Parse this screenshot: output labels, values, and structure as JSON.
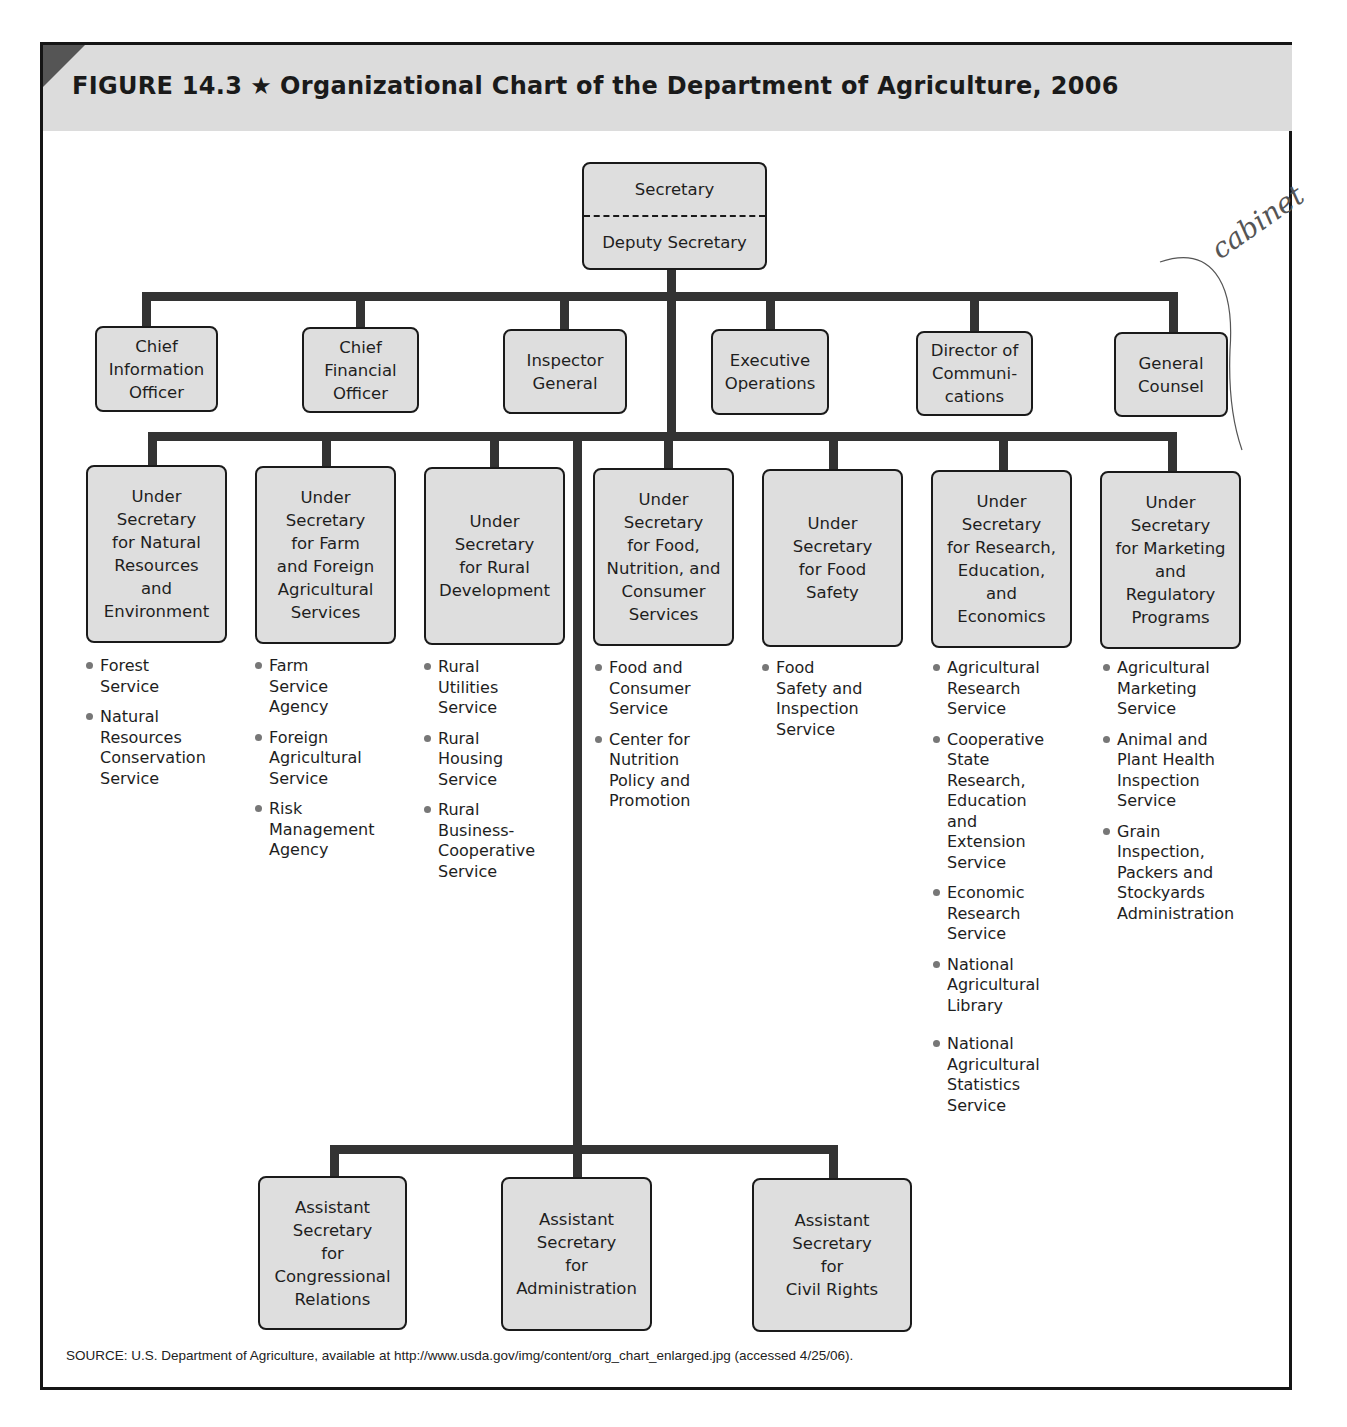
{
  "figure": {
    "label": "FIGURE 14.3",
    "star": "★",
    "title": "Organizational Chart of the Department of Agriculture, 2006"
  },
  "top": {
    "secretary": "Secretary",
    "deputy": "Deputy Secretary"
  },
  "staff_offices": [
    {
      "label": "Chief\nInformation\nOfficer"
    },
    {
      "label": "Chief\nFinancial\nOfficer"
    },
    {
      "label": "Inspector\nGeneral"
    },
    {
      "label": "Executive\nOperations"
    },
    {
      "label": "Director of\nCommuni-\ncations"
    },
    {
      "label": "General\nCounsel"
    }
  ],
  "under_secretaries": [
    {
      "label": "Under\nSecretary\nfor Natural\nResources\nand\nEnvironment",
      "agencies": [
        "Forest\nService",
        "Natural\nResources\nConservation\nService"
      ]
    },
    {
      "label": "Under\nSecretary\nfor Farm\nand Foreign\nAgricultural\nServices",
      "agencies": [
        "Farm\nService\nAgency",
        "Foreign\nAgricultural\nService",
        "Risk\nManagement\nAgency"
      ]
    },
    {
      "label": "Under\nSecretary\nfor Rural\nDevelopment",
      "agencies": [
        "Rural\nUtilities\nService",
        "Rural\nHousing\nService",
        "Rural\nBusiness-\nCooperative\nService"
      ]
    },
    {
      "label": "Under\nSecretary\nfor Food,\nNutrition, and\nConsumer\nServices",
      "agencies": [
        "Food and\nConsumer\nService",
        "Center for\nNutrition\nPolicy and\nPromotion"
      ]
    },
    {
      "label": "Under\nSecretary\nfor Food\nSafety",
      "agencies": [
        "Food\nSafety and\nInspection\nService"
      ]
    },
    {
      "label": "Under\nSecretary\nfor Research,\nEducation,\nand\nEconomics",
      "agencies": [
        "Agricultural\nResearch\nService",
        "Cooperative\nState\nResearch,\nEducation\nand\nExtension\nService",
        "Economic\nResearch\nService",
        "National\nAgricultural\nLibrary",
        "National\nAgricultural\nStatistics\nService"
      ]
    },
    {
      "label": "Under\nSecretary\nfor Marketing\nand\nRegulatory\nPrograms",
      "agencies": [
        "Agricultural\nMarketing\nService",
        "Animal and\nPlant Health\nInspection\nService",
        "Grain\nInspection,\nPackers and\nStockyards\nAdministration"
      ]
    }
  ],
  "assistant_secretaries": [
    {
      "label": "Assistant\nSecretary\nfor\nCongressional\nRelations"
    },
    {
      "label": "Assistant\nSecretary\nfor\nAdministration"
    },
    {
      "label": "Assistant\nSecretary\nfor\nCivil Rights"
    }
  ],
  "source": "SOURCE: U.S. Department of Agriculture, available at http://www.usda.gov/img/content/org_chart_enlarged.jpg (accessed 4/25/06).",
  "annotation": {
    "handwritten": "cabinet"
  },
  "colors": {
    "box_fill": "#dedede",
    "line": "#333333",
    "title_band": "#dcdcdc",
    "corner": "#555555"
  }
}
